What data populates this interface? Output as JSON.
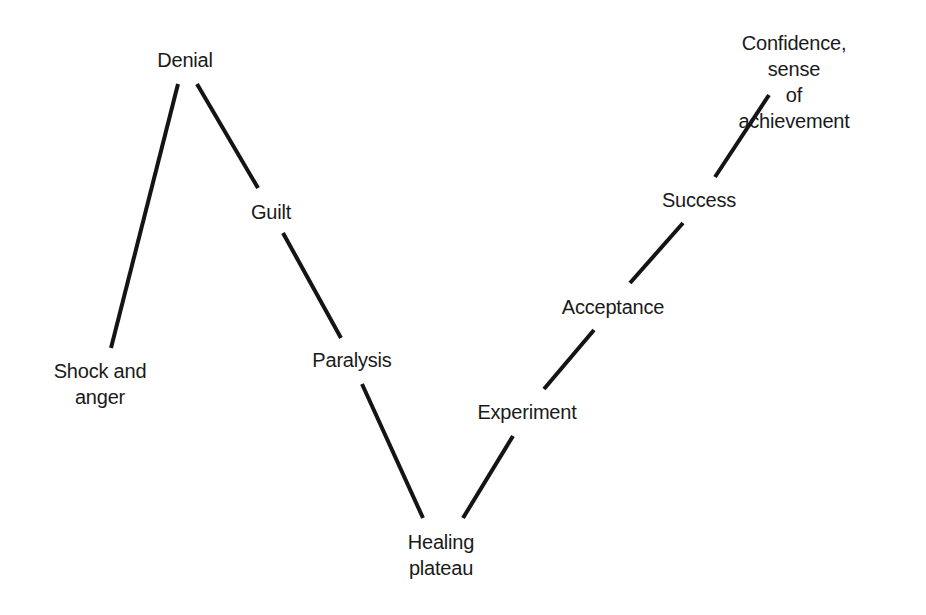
{
  "diagram": {
    "type": "change-curve",
    "stages": [
      {
        "id": "shock",
        "label": "Shock and\nanger"
      },
      {
        "id": "denial",
        "label": "Denial"
      },
      {
        "id": "guilt",
        "label": "Guilt"
      },
      {
        "id": "paralysis",
        "label": "Paralysis"
      },
      {
        "id": "healing",
        "label": "Healing\nplateau"
      },
      {
        "id": "experiment",
        "label": "Experiment"
      },
      {
        "id": "acceptance",
        "label": "Acceptance"
      },
      {
        "id": "success",
        "label": "Success"
      },
      {
        "id": "confidence",
        "label": "Confidence, sense\nof achievement"
      }
    ],
    "connections": [
      {
        "from": "shock",
        "to": "denial"
      },
      {
        "from": "denial",
        "to": "guilt"
      },
      {
        "from": "guilt",
        "to": "paralysis"
      },
      {
        "from": "paralysis",
        "to": "healing"
      },
      {
        "from": "healing",
        "to": "experiment"
      },
      {
        "from": "experiment",
        "to": "acceptance"
      },
      {
        "from": "acceptance",
        "to": "success"
      },
      {
        "from": "success",
        "to": "confidence"
      }
    ],
    "line_color": "#141414",
    "background": "#ffffff"
  }
}
